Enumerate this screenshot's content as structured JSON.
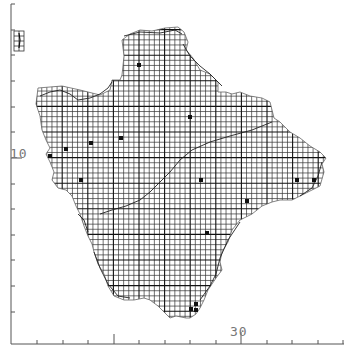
{
  "map": {
    "type": "grid-distribution-map",
    "region_shape": "county outline with 2km tetrad grid",
    "colors": {
      "background": "#ffffff",
      "grid_line": "#333333",
      "grid_major": "#111111",
      "outline": "#222222",
      "dot": "#111111",
      "axis": "#555555",
      "axis_label": "#777777"
    },
    "axes": {
      "y_label": "10",
      "x_label": "30",
      "tick_spacing_px": 25.6,
      "y_axis_x": 11,
      "x_axis_y": 344
    },
    "grid": {
      "cell_px": 5.12,
      "major_every_cells": 5
    },
    "records": [
      {
        "x": 139,
        "y": 65
      },
      {
        "x": 190,
        "y": 117
      },
      {
        "x": 121,
        "y": 138
      },
      {
        "x": 91,
        "y": 143
      },
      {
        "x": 66,
        "y": 149
      },
      {
        "x": 50,
        "y": 156
      },
      {
        "x": 81,
        "y": 180
      },
      {
        "x": 201,
        "y": 180
      },
      {
        "x": 297,
        "y": 180
      },
      {
        "x": 314,
        "y": 180
      },
      {
        "x": 247,
        "y": 201
      },
      {
        "x": 207,
        "y": 233
      },
      {
        "x": 191,
        "y": 309
      },
      {
        "x": 196,
        "y": 310
      },
      {
        "x": 196,
        "y": 304
      }
    ],
    "inset": {
      "label": "Lundy"
    }
  }
}
